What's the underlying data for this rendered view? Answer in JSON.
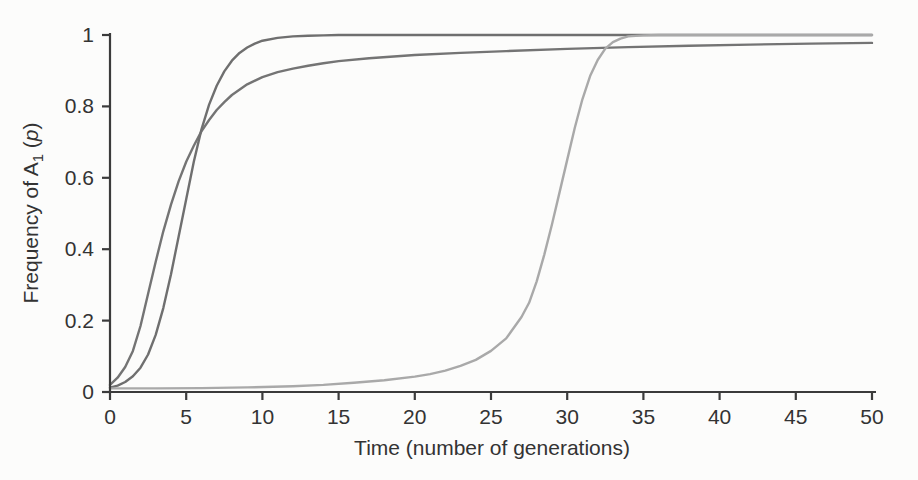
{
  "figure": {
    "background": "#fcfcfb",
    "axis_color": "#3b3b3b",
    "text_color": "#333333"
  },
  "chart_data": {
    "type": "line",
    "title": "",
    "xlabel": {
      "text": "Time (number of generations)"
    },
    "ylabel": {
      "prefix": "Frequency of A",
      "subscript": "1",
      "mid": " (",
      "italic_var": "p",
      "suffix": ")"
    },
    "xlim": [
      0,
      50
    ],
    "ylim": [
      0,
      1
    ],
    "x_ticks": [
      0,
      5,
      10,
      15,
      20,
      25,
      30,
      35,
      40,
      45,
      50
    ],
    "x_tick_labels": [
      "0",
      "5",
      "10",
      "15",
      "20",
      "25",
      "30",
      "35",
      "40",
      "45",
      "50"
    ],
    "y_ticks": [
      0,
      0.2,
      0.4,
      0.6,
      0.8,
      1
    ],
    "y_tick_labels": [
      "0",
      "0.2",
      "0.4",
      "0.6",
      "0.8",
      "1"
    ],
    "grid": false,
    "legend": "none",
    "series": [
      {
        "name": "early-rise-slow-fixation-curve",
        "color": "#747474",
        "width": 2.4,
        "points": [
          [
            0,
            0.02
          ],
          [
            0.5,
            0.04
          ],
          [
            1,
            0.07
          ],
          [
            1.5,
            0.115
          ],
          [
            2,
            0.185
          ],
          [
            2.5,
            0.275
          ],
          [
            3,
            0.365
          ],
          [
            3.5,
            0.45
          ],
          [
            4,
            0.525
          ],
          [
            4.5,
            0.59
          ],
          [
            5,
            0.645
          ],
          [
            5.5,
            0.69
          ],
          [
            6,
            0.73
          ],
          [
            6.5,
            0.762
          ],
          [
            7,
            0.79
          ],
          [
            7.5,
            0.812
          ],
          [
            8,
            0.832
          ],
          [
            9,
            0.862
          ],
          [
            10,
            0.882
          ],
          [
            11,
            0.896
          ],
          [
            12,
            0.906
          ],
          [
            13,
            0.914
          ],
          [
            14,
            0.921
          ],
          [
            15,
            0.927
          ],
          [
            17,
            0.935
          ],
          [
            20,
            0.944
          ],
          [
            23,
            0.95
          ],
          [
            26,
            0.955
          ],
          [
            30,
            0.961
          ],
          [
            34,
            0.966
          ],
          [
            38,
            0.97
          ],
          [
            42,
            0.973
          ],
          [
            46,
            0.976
          ],
          [
            50,
            0.978
          ]
        ]
      },
      {
        "name": "sigmoid-rapid-fixation-curve",
        "color": "#6f6f6f",
        "width": 2.4,
        "points": [
          [
            0,
            0.012
          ],
          [
            0.5,
            0.018
          ],
          [
            1,
            0.028
          ],
          [
            1.5,
            0.044
          ],
          [
            2,
            0.068
          ],
          [
            2.5,
            0.105
          ],
          [
            3,
            0.16
          ],
          [
            3.5,
            0.235
          ],
          [
            4,
            0.33
          ],
          [
            4.5,
            0.435
          ],
          [
            5,
            0.54
          ],
          [
            5.5,
            0.645
          ],
          [
            6,
            0.735
          ],
          [
            6.5,
            0.805
          ],
          [
            7,
            0.858
          ],
          [
            7.5,
            0.898
          ],
          [
            8,
            0.928
          ],
          [
            8.5,
            0.95
          ],
          [
            9,
            0.965
          ],
          [
            9.5,
            0.976
          ],
          [
            10,
            0.984
          ],
          [
            11,
            0.992
          ],
          [
            12,
            0.996
          ],
          [
            13,
            0.998
          ],
          [
            14,
            0.999
          ],
          [
            15,
            1
          ],
          [
            18,
            1
          ],
          [
            22,
            1
          ],
          [
            26,
            1
          ],
          [
            30,
            1
          ],
          [
            35,
            1
          ],
          [
            40,
            1
          ],
          [
            45,
            1
          ],
          [
            50,
            1
          ]
        ]
      },
      {
        "name": "delayed-rise-rapid-fixation-curve",
        "color": "#a9a9a9",
        "width": 2.4,
        "points": [
          [
            0,
            0.01
          ],
          [
            3,
            0.01
          ],
          [
            6,
            0.011
          ],
          [
            9,
            0.013
          ],
          [
            12,
            0.016
          ],
          [
            14,
            0.02
          ],
          [
            16,
            0.026
          ],
          [
            18,
            0.033
          ],
          [
            20,
            0.043
          ],
          [
            21,
            0.05
          ],
          [
            22,
            0.06
          ],
          [
            23,
            0.073
          ],
          [
            24,
            0.09
          ],
          [
            25,
            0.115
          ],
          [
            26,
            0.15
          ],
          [
            27,
            0.21
          ],
          [
            27.5,
            0.25
          ],
          [
            28,
            0.31
          ],
          [
            28.5,
            0.385
          ],
          [
            29,
            0.47
          ],
          [
            29.5,
            0.56
          ],
          [
            30,
            0.65
          ],
          [
            30.5,
            0.74
          ],
          [
            31,
            0.82
          ],
          [
            31.5,
            0.885
          ],
          [
            32,
            0.93
          ],
          [
            32.5,
            0.962
          ],
          [
            33,
            0.98
          ],
          [
            33.5,
            0.99
          ],
          [
            34,
            0.996
          ],
          [
            35,
            0.999
          ],
          [
            36,
            1
          ],
          [
            40,
            1
          ],
          [
            45,
            1
          ],
          [
            50,
            1
          ]
        ]
      }
    ]
  }
}
